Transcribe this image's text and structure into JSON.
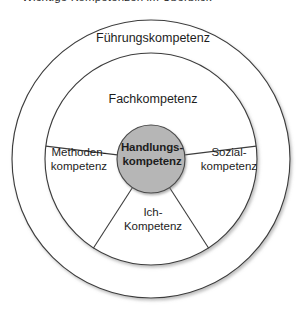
{
  "caption": {
    "text": "Wichtige Kompetenzen im Überblick"
  },
  "diagram": {
    "type": "concentric-circle-segment-diagram",
    "colors": {
      "background": "#ffffff",
      "stroke": "#3d3d3d",
      "core_fill": "#b6b6b6",
      "core_stroke": "#4a4a4a",
      "text": "#1d1d1d"
    },
    "geometry": {
      "center_x": 151,
      "center_y": 159,
      "outer_ring_radius": 139,
      "inner_ring_radius": 106,
      "core_radius": 34
    },
    "rings": [
      {
        "name": "outer-ring",
        "label": "Führungskompetenz"
      },
      {
        "name": "inner-ring",
        "segments": [
          {
            "name": "fach",
            "label": "Fachkompetenz"
          },
          {
            "name": "methoden",
            "label": "Methoden-\nkompetenz"
          },
          {
            "name": "sozial",
            "label": "Sozial-\nkompetenz"
          },
          {
            "name": "ich",
            "label": "Ich-\nKompetenz"
          }
        ]
      }
    ],
    "core": {
      "name": "handlungskompetenz",
      "label": "Handlungs-\nkompetenz"
    }
  }
}
